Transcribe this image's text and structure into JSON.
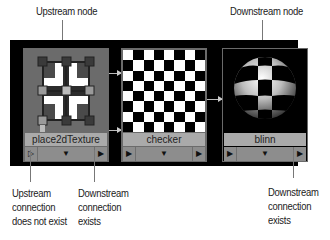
{
  "callouts": {
    "upstream_node": "Upstream node",
    "downstream_node": "Downstream node",
    "upstream_conn_missing": [
      "Upstream",
      "connection",
      "does not exist"
    ],
    "downstream_conn_exists_1": [
      "Downstream",
      "connection",
      "exists"
    ],
    "downstream_conn_exists_2": [
      "Downstream",
      "connection",
      "exists"
    ]
  },
  "nodes": [
    {
      "name": "place2dTexture",
      "swatch": "place2d-manipulator",
      "left_port": "▷",
      "mid_port": "▼",
      "right_port": "▶",
      "upstream_connected": false
    },
    {
      "name": "checker",
      "swatch": "checker-8x8",
      "left_port": "▶",
      "mid_port": "▼",
      "right_port": "▶",
      "upstream_connected": true
    },
    {
      "name": "blinn",
      "swatch": "checker-sphere",
      "left_port": "▶",
      "mid_port": "▼",
      "right_port": "▶",
      "upstream_connected": true
    }
  ],
  "colors": {
    "panel": "#000000",
    "node_body": "#6b6b6b",
    "namebar": "#aaaaaa",
    "portbar": "#8d8d8d",
    "connection": "#bbbbbb"
  }
}
